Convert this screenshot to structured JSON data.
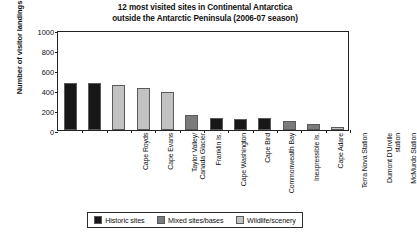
{
  "chart_data": {
    "type": "bar",
    "title": "12 most visited sites in Continental Antarctica outside the Antarctic Peninsula (2006-07 season)",
    "title_line1": "12 most visited sites in Continental Antarctica",
    "title_line2": "outside the Antarctic Peninsula (2006-07 season)",
    "xlabel": "",
    "ylabel": "Number of visitor landings",
    "ylim": [
      0,
      1000
    ],
    "ytick_labels": [
      "1000",
      "800",
      "600",
      "400",
      "200",
      "0"
    ],
    "ytick_values": [
      1000,
      800,
      600,
      400,
      200,
      0
    ],
    "grid": false,
    "legend_position": "bottom",
    "categories": [
      "Cape Royds",
      "Cape Evans",
      "Taylor Valley/\nCanada Glacier",
      "Franklin Is.",
      "Cape Washington",
      "Cape Bird",
      "Commonwealth Bay",
      "Inexpressible Is.",
      "Cape Adare",
      "Terra Nova Station",
      "Dumont D'Urville\nstation",
      "McMurdo Station"
    ],
    "values": [
      470,
      470,
      450,
      420,
      380,
      150,
      120,
      115,
      120,
      95,
      60,
      35
    ],
    "bar_categories": [
      "historic",
      "historic",
      "wildlife",
      "wildlife",
      "wildlife",
      "mixed",
      "historic",
      "historic",
      "historic",
      "mixed",
      "mixed",
      "wildlife"
    ],
    "legend": [
      {
        "key": "historic",
        "label": "Historic sites",
        "color": "#171717"
      },
      {
        "key": "mixed",
        "label": "Mixed sites/bases",
        "color": "#7b7b7b"
      },
      {
        "key": "wildlife",
        "label": "Wildlife/scenery",
        "color": "#c2c2c2"
      }
    ],
    "colors": {
      "historic": "#171717",
      "mixed": "#7b7b7b",
      "wildlife": "#c2c2c2",
      "axis": "#222222",
      "text": "#111111",
      "background": "#ffffff"
    }
  }
}
